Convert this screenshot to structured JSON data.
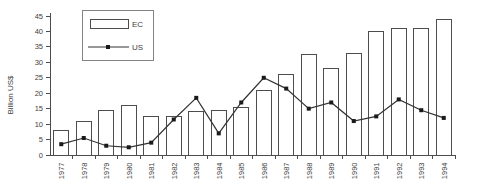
{
  "chart_data": {
    "type": "bar+line",
    "title": "",
    "xlabel": "",
    "ylabel": "Billion US$",
    "ylim": [
      0,
      45
    ],
    "ytick_step": 5,
    "grid": false,
    "legend_position": "top-left-inside",
    "categories": [
      "1977",
      "1978",
      "1979",
      "1980",
      "1981",
      "1982",
      "1983",
      "1984",
      "1985",
      "1986",
      "1987",
      "1988",
      "1989",
      "1990",
      "1991",
      "1992",
      "1993",
      "1994"
    ],
    "series": [
      {
        "name": "EC",
        "type": "bar",
        "values": [
          8,
          11,
          14.5,
          16,
          12.5,
          12.5,
          14,
          14.5,
          15.5,
          21,
          26,
          32.5,
          28,
          33,
          40,
          41,
          41,
          44
        ]
      },
      {
        "name": "US",
        "type": "line",
        "values": [
          3.5,
          5.5,
          3,
          2.5,
          4,
          11.5,
          18.5,
          7,
          17,
          25,
          21.5,
          15,
          17,
          11,
          12.5,
          18,
          14.5,
          12
        ]
      }
    ],
    "colors": {
      "background": "#ffffff",
      "bar_fill": "#ffffff",
      "bar_stroke": "#4d4d4d",
      "line": "#333333",
      "marker": "#1a1a1a",
      "axis": "#4d4d4d",
      "text": "#404040",
      "legend_border": "#848484"
    }
  }
}
